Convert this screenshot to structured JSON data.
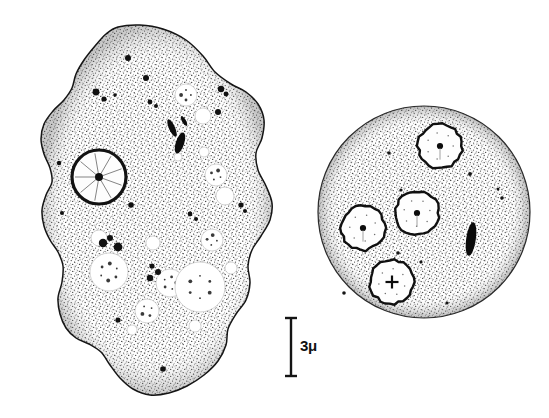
{
  "figure": {
    "medium": "stippled pen-and-ink scientific illustration",
    "background_color": "#ffffff",
    "ink_color": "#1a1a1a",
    "canvas": {
      "width": 549,
      "height": 418
    }
  },
  "scale_bar": {
    "label": "3μ",
    "value": 3,
    "unit": "μ",
    "orientation": "vertical",
    "x": 291,
    "y_top": 318,
    "y_bottom": 376,
    "cap_half_width": 6,
    "label_x": 300,
    "label_y": 337
  },
  "cells": [
    {
      "id": "trophozoite",
      "name": "amoeboid trophozoite",
      "shape": "irregular lobed outline with pseudopodia",
      "cytoplasm_fill": "stipple",
      "center": {
        "x": 150,
        "y": 210
      },
      "outline_points": [
        [
          118,
          27
        ],
        [
          140,
          25
        ],
        [
          163,
          29
        ],
        [
          186,
          40
        ],
        [
          203,
          56
        ],
        [
          215,
          72
        ],
        [
          231,
          84
        ],
        [
          246,
          92
        ],
        [
          258,
          104
        ],
        [
          264,
          120
        ],
        [
          262,
          138
        ],
        [
          256,
          153
        ],
        [
          258,
          170
        ],
        [
          266,
          186
        ],
        [
          272,
          203
        ],
        [
          270,
          220
        ],
        [
          261,
          236
        ],
        [
          252,
          250
        ],
        [
          248,
          266
        ],
        [
          250,
          283
        ],
        [
          246,
          300
        ],
        [
          236,
          314
        ],
        [
          228,
          329
        ],
        [
          226,
          345
        ],
        [
          218,
          361
        ],
        [
          204,
          375
        ],
        [
          187,
          386
        ],
        [
          169,
          393
        ],
        [
          150,
          395
        ],
        [
          133,
          389
        ],
        [
          120,
          378
        ],
        [
          110,
          365
        ],
        [
          101,
          352
        ],
        [
          89,
          344
        ],
        [
          76,
          338
        ],
        [
          66,
          328
        ],
        [
          60,
          314
        ],
        [
          58,
          298
        ],
        [
          62,
          282
        ],
        [
          63,
          266
        ],
        [
          58,
          252
        ],
        [
          50,
          240
        ],
        [
          44,
          226
        ],
        [
          42,
          210
        ],
        [
          46,
          195
        ],
        [
          52,
          182
        ],
        [
          50,
          168
        ],
        [
          44,
          154
        ],
        [
          41,
          139
        ],
        [
          44,
          124
        ],
        [
          53,
          111
        ],
        [
          64,
          100
        ],
        [
          72,
          88
        ],
        [
          76,
          74
        ],
        [
          84,
          60
        ],
        [
          95,
          46
        ],
        [
          106,
          34
        ]
      ],
      "nucleus": {
        "center": {
          "x": 99,
          "y": 177
        },
        "radius": 27,
        "ring_width": 3.2,
        "karyosome_radius": 4,
        "spokes": 9,
        "description": "thick dark ring, pale interior, central karyosome with radiating linin spokes"
      },
      "vacuoles": [
        {
          "cx": 186,
          "cy": 95,
          "r": 11
        },
        {
          "cx": 203,
          "cy": 116,
          "r": 8
        },
        {
          "cx": 216,
          "cy": 175,
          "r": 11
        },
        {
          "cx": 225,
          "cy": 196,
          "r": 9
        },
        {
          "cx": 204,
          "cy": 152,
          "r": 5
        },
        {
          "cx": 178,
          "cy": 157,
          "r": 4
        },
        {
          "cx": 99,
          "cy": 238,
          "r": 8
        },
        {
          "cx": 153,
          "cy": 243,
          "r": 7
        },
        {
          "cx": 212,
          "cy": 240,
          "r": 11
        },
        {
          "cx": 109,
          "cy": 272,
          "r": 19
        },
        {
          "cx": 170,
          "cy": 283,
          "r": 14
        },
        {
          "cx": 200,
          "cy": 287,
          "r": 25
        },
        {
          "cx": 147,
          "cy": 311,
          "r": 12
        },
        {
          "cx": 132,
          "cy": 330,
          "r": 5
        },
        {
          "cx": 195,
          "cy": 326,
          "r": 6
        },
        {
          "cx": 231,
          "cy": 268,
          "r": 6
        }
      ],
      "dark_granules": [
        {
          "cx": 96,
          "cy": 92,
          "r": 3.4
        },
        {
          "cx": 104,
          "cy": 99,
          "r": 2.6
        },
        {
          "cx": 115,
          "cy": 95,
          "r": 1.8
        },
        {
          "cx": 146,
          "cy": 78,
          "r": 3.0
        },
        {
          "cx": 150,
          "cy": 102,
          "r": 2.4
        },
        {
          "cx": 156,
          "cy": 106,
          "r": 2.0
        },
        {
          "cx": 221,
          "cy": 89,
          "r": 3.2
        },
        {
          "cx": 226,
          "cy": 94,
          "r": 2.4
        },
        {
          "cx": 218,
          "cy": 112,
          "r": 3.0
        },
        {
          "cx": 241,
          "cy": 205,
          "r": 2.6
        },
        {
          "cx": 245,
          "cy": 211,
          "r": 2.0
        },
        {
          "cx": 103,
          "cy": 243,
          "r": 4.2
        },
        {
          "cx": 110,
          "cy": 238,
          "r": 3.0
        },
        {
          "cx": 118,
          "cy": 247,
          "r": 4.4
        },
        {
          "cx": 152,
          "cy": 266,
          "r": 2.6
        },
        {
          "cx": 158,
          "cy": 272,
          "r": 3.0
        },
        {
          "cx": 150,
          "cy": 278,
          "r": 3.2
        },
        {
          "cx": 190,
          "cy": 214,
          "r": 2.4
        },
        {
          "cx": 196,
          "cy": 219,
          "r": 2.0
        },
        {
          "cx": 131,
          "cy": 205,
          "r": 2.8
        },
        {
          "cx": 118,
          "cy": 320,
          "r": 2.6
        },
        {
          "cx": 163,
          "cy": 369,
          "r": 2.8
        },
        {
          "cx": 59,
          "cy": 163,
          "r": 2.2
        },
        {
          "cx": 62,
          "cy": 213,
          "r": 2.0
        },
        {
          "cx": 128,
          "cy": 58,
          "r": 3.0
        }
      ],
      "chromatoid_bodies": [
        {
          "cx": 172,
          "cy": 128,
          "rx": 3.0,
          "ry": 9.5,
          "angle": -24
        },
        {
          "cx": 180,
          "cy": 143,
          "rx": 4.2,
          "ry": 11.0,
          "angle": 18
        },
        {
          "cx": 184,
          "cy": 121,
          "rx": 2.0,
          "ry": 5.5,
          "angle": -30
        }
      ]
    },
    {
      "id": "cyst",
      "name": "quadrinucleate cyst",
      "shape": "circular",
      "cytoplasm_fill": "stipple",
      "center": {
        "x": 424,
        "y": 212
      },
      "radius": 106,
      "nuclei": [
        {
          "cx": 440,
          "cy": 146,
          "r": 22,
          "karyosome": "dot",
          "label": "nucleus-1"
        },
        {
          "cx": 417,
          "cy": 213,
          "r": 22,
          "karyosome": "dot",
          "label": "nucleus-2"
        },
        {
          "cx": 363,
          "cy": 228,
          "r": 22,
          "karyosome": "dot",
          "label": "nucleus-3"
        },
        {
          "cx": 392,
          "cy": 282,
          "r": 22,
          "karyosome": "cross",
          "label": "nucleus-4"
        }
      ],
      "chromatoid_bodies": [
        {
          "cx": 471,
          "cy": 239,
          "rx": 4.8,
          "ry": 17,
          "angle": 8
        }
      ],
      "dark_granules": [
        {
          "cx": 389,
          "cy": 153,
          "r": 1.8
        },
        {
          "cx": 470,
          "cy": 174,
          "r": 1.9
        },
        {
          "cx": 502,
          "cy": 198,
          "r": 1.8
        },
        {
          "cx": 401,
          "cy": 190,
          "r": 1.6
        },
        {
          "cx": 398,
          "cy": 253,
          "r": 1.8
        },
        {
          "cx": 421,
          "cy": 262,
          "r": 1.6
        },
        {
          "cx": 344,
          "cy": 293,
          "r": 1.8
        },
        {
          "cx": 447,
          "cy": 303,
          "r": 1.6
        },
        {
          "cx": 498,
          "cy": 189,
          "r": 1.5
        }
      ]
    }
  ]
}
